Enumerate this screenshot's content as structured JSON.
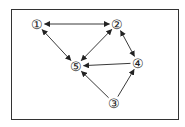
{
  "diagram": {
    "type": "directed-graph",
    "frame": {
      "x": 11,
      "y": 9,
      "width": 167,
      "height": 110,
      "stroke": "#333333"
    },
    "colors": {
      "edge": "#222222",
      "node_text": "#222222",
      "background": "#ffffff"
    },
    "nodes": [
      {
        "id": "1",
        "label": "①",
        "x": 37,
        "y": 24
      },
      {
        "id": "2",
        "label": "②",
        "x": 117,
        "y": 24
      },
      {
        "id": "3",
        "label": "③",
        "x": 114,
        "y": 103
      },
      {
        "id": "4",
        "label": "④",
        "x": 138,
        "y": 63
      },
      {
        "id": "5",
        "label": "⑤",
        "x": 76,
        "y": 66
      }
    ],
    "edges": [
      {
        "from": "1",
        "to": "2",
        "bidirectional": true
      },
      {
        "from": "1",
        "to": "5",
        "bidirectional": true
      },
      {
        "from": "2",
        "to": "5",
        "bidirectional": true
      },
      {
        "from": "2",
        "to": "4",
        "bidirectional": true
      },
      {
        "from": "4",
        "to": "5",
        "bidirectional": false
      },
      {
        "from": "3",
        "to": "5",
        "bidirectional": false
      },
      {
        "from": "3",
        "to": "4",
        "bidirectional": false
      }
    ]
  }
}
